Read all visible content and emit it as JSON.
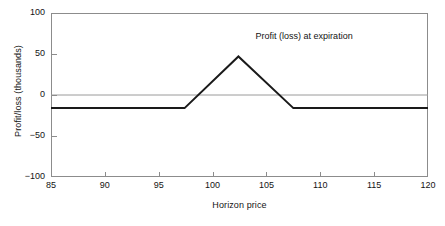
{
  "chart_data": {
    "type": "line",
    "title": "",
    "annotations": [
      {
        "text": "Profit (loss) at expiration",
        "x": 108.5,
        "y": 72
      }
    ],
    "xlabel": "Horizon price",
    "ylabel": "Profit/loss (thousands)",
    "xlim": [
      85,
      120
    ],
    "ylim": [
      -100,
      100
    ],
    "xticks": [
      85,
      90,
      95,
      100,
      105,
      110,
      115,
      120
    ],
    "xticklabels": [
      "85",
      "90",
      "95",
      "100",
      "105",
      "110",
      "115",
      "120"
    ],
    "yticks": [
      -100,
      -50,
      0,
      50,
      100
    ],
    "yticklabels": [
      "−100",
      "−50",
      "0",
      "50",
      "100"
    ],
    "grid": false,
    "legend": null,
    "zero_line": {
      "value": 0,
      "color": "#9a9a9a"
    },
    "series": [
      {
        "name": "Profit (loss) at expiration",
        "color": "#1a1a1a",
        "width": 2,
        "x": [
          85,
          97.4,
          102.4,
          107.5,
          120
        ],
        "y": [
          -16,
          -16,
          47,
          -16,
          -16
        ]
      }
    ]
  },
  "colors": {
    "line": "#1a1a1a",
    "axis": "#8c8c8c",
    "zero": "#9a9a9a",
    "text": "#141414",
    "background": "#ffffff"
  }
}
